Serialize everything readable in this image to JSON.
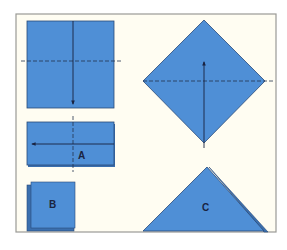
{
  "figure": {
    "type": "folding-diagram",
    "colors": {
      "paper": "#4f8fd6",
      "paper_shadow": "#3b6fae",
      "edge": "#2a4a78",
      "fold_line": "#23324f",
      "background": "#fffdf2",
      "frame_border": "#9a9a96"
    },
    "steps": [
      {
        "id": "square",
        "label": "",
        "fold": "horizontal-center",
        "arrow": "down"
      },
      {
        "id": "rectangle",
        "label": "A",
        "fold": "vertical-center",
        "arrow": "left"
      },
      {
        "id": "small-square",
        "label": "B",
        "fold": "none",
        "arrow": "none"
      },
      {
        "id": "diamond",
        "label": "",
        "fold": "horizontal-center",
        "arrow": "up"
      },
      {
        "id": "triangle",
        "label": "C",
        "fold": "none",
        "arrow": "none"
      }
    ],
    "labels": {
      "a": "A",
      "b": "B",
      "c": "C"
    }
  }
}
